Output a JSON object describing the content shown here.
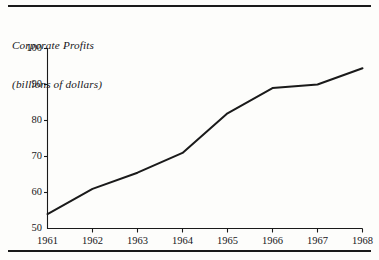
{
  "figure": {
    "title_line_1": "Corporate Profits",
    "title_line_2": "(billions of dollars)",
    "rule_top_name": "top-rule",
    "rule_bottom_name": "bottom-rule",
    "line_color": "#1a1a1a",
    "axis_color": "#1a1a1a",
    "background_color": "#fdfdfb"
  },
  "chart_data": {
    "type": "line",
    "title": "Corporate Profits (billions of dollars)",
    "xlabel": "",
    "ylabel": "Corporate Profits (billions of dollars)",
    "x": [
      1961,
      1962,
      1963,
      1964,
      1965,
      1966,
      1967,
      1968
    ],
    "categories": [
      "1961",
      "1962",
      "1963",
      "1964",
      "1965",
      "1966",
      "1967",
      "1968"
    ],
    "values": [
      54,
      61,
      65.5,
      71,
      82,
      89,
      90,
      94.5
    ],
    "series": [
      {
        "name": "Corporate Profits",
        "values": [
          54,
          61,
          65.5,
          71,
          82,
          89,
          90,
          94.5
        ]
      }
    ],
    "xlim": [
      1961,
      1968
    ],
    "ylim": [
      50,
      100
    ],
    "yticks": [
      50,
      60,
      70,
      80,
      90,
      100
    ],
    "ytick_labels": [
      "50",
      "60",
      "70",
      "80",
      "90",
      "100"
    ],
    "xticks": [
      1961,
      1962,
      1963,
      1964,
      1965,
      1966,
      1967,
      1968
    ],
    "xtick_labels": [
      "1961",
      "1962",
      "1963",
      "1964",
      "1965",
      "1966",
      "1967",
      "1968"
    ],
    "grid": false,
    "legend": false,
    "legend_position": "none"
  }
}
